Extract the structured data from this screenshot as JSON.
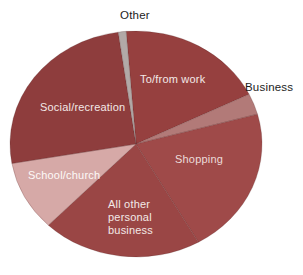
{
  "figure": {
    "background_color": "#ffffff",
    "kind": "pie-chart-figure"
  },
  "chart_data": {
    "type": "pie",
    "title": "",
    "legend": "none",
    "units": "share of trips (unlabeled in figure, estimated from slice angles, %)",
    "categories": [
      "To/from work",
      "Business",
      "Shopping",
      "All other personal business",
      "School/church",
      "Social/recreation",
      "Other"
    ],
    "values": [
      19,
      3,
      21,
      20.5,
      10,
      25.5,
      1
    ],
    "colors": [
      "#96403f",
      "#b27a78",
      "#9f4a49",
      "#9a4645",
      "#d6a9a7",
      "#8e3d3d",
      "#b2a9a7"
    ],
    "start_angle_deg": -4.5,
    "geometry": {
      "cx": 136,
      "cy": 144,
      "rx": 126,
      "ry": 113
    },
    "slice_stroke": "rgba(70,30,30,0.35)",
    "labels": [
      {
        "text": "To/from work",
        "placement": "inside",
        "color": "#f3e9e7",
        "left": 140,
        "top": 73
      },
      {
        "text": "Business",
        "placement": "outside",
        "color": "#1c1c1c",
        "left": 245,
        "top": 81
      },
      {
        "text": "Shopping",
        "placement": "inside",
        "color": "#ecdcda",
        "left": 175,
        "top": 153
      },
      {
        "text": "All other\npersonal\nbusiness",
        "placement": "inside",
        "color": "#f3e9e7",
        "left": 108,
        "top": 198
      },
      {
        "text": "School/church",
        "placement": "inside",
        "color": "#fdf9f8",
        "left": 28,
        "top": 169
      },
      {
        "text": "Social/recreation",
        "placement": "inside",
        "color": "#f3e9e7",
        "left": 40,
        "top": 101
      },
      {
        "text": "Other",
        "placement": "outside",
        "color": "#1c1c1c",
        "left": 120,
        "top": 9
      }
    ]
  }
}
